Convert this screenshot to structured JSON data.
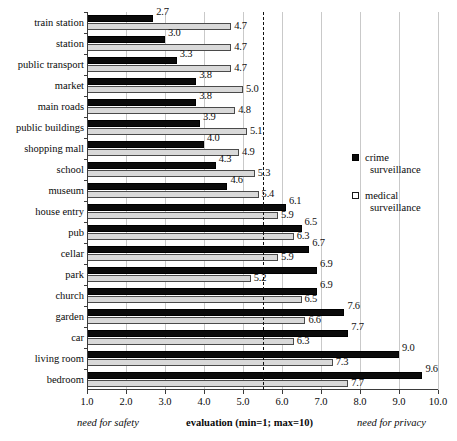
{
  "chart_data": {
    "type": "bar",
    "orientation": "horizontal",
    "title": "",
    "xlabel": "evaluation (min=1; max=10)",
    "ylabel": "",
    "xlim": [
      1.0,
      10.0
    ],
    "xticks": [
      "1.0",
      "2.0",
      "3.0",
      "4.0",
      "5.0",
      "6.0",
      "7.0",
      "8.0",
      "9.0",
      "10.0"
    ],
    "grid": true,
    "legend_position": "right",
    "reference_line": 5.5,
    "categories": [
      "train station",
      "station",
      "public transport",
      "market",
      "main roads",
      "public buildings",
      "shopping mall",
      "school",
      "museum",
      "house entry",
      "pub",
      "cellar",
      "park",
      "church",
      "garden",
      "car",
      "living room",
      "bedroom"
    ],
    "series": [
      {
        "name": "crime surveillance",
        "color": "#0b0b0b",
        "values": [
          2.7,
          3.0,
          3.3,
          3.8,
          3.8,
          3.9,
          4.0,
          4.3,
          4.6,
          6.1,
          6.5,
          6.7,
          6.9,
          6.9,
          7.6,
          7.7,
          9.0,
          9.6
        ],
        "labels": [
          "2.7",
          "3.0",
          "3.3",
          "3.8",
          "3.8",
          "3.9",
          "4.0",
          "4.3",
          "4.6",
          "6.1",
          "6.5",
          "6.7",
          "6.9",
          "6.9",
          "7.6",
          "7.7",
          "9.0",
          "9.6"
        ]
      },
      {
        "name": "medical surveillance",
        "color": "#d9d9d9",
        "values": [
          4.7,
          4.7,
          4.7,
          5.0,
          4.8,
          5.1,
          4.9,
          5.3,
          5.4,
          5.9,
          6.3,
          5.9,
          5.2,
          6.5,
          6.6,
          6.3,
          7.3,
          7.7
        ],
        "labels": [
          "4.7",
          "4.7",
          "4.7",
          "5.0",
          "4.8",
          "5.1",
          "4.9",
          "5.3",
          "5.4",
          "5.9",
          "6.3",
          "5.9",
          "5.2",
          "6.5",
          "6.6",
          "6.3",
          "7.3",
          "7.7"
        ]
      }
    ],
    "annotations": {
      "left_caption": "need for safety",
      "center_caption": "evaluation (min=1; max=10)",
      "right_caption": "need for privacy"
    }
  },
  "legend": {
    "items": [
      {
        "line1": "crime",
        "line2": "surveillance",
        "swatch": "filled-square-icon"
      },
      {
        "line1": "medical",
        "line2": "surveillance",
        "swatch": "open-square-icon"
      }
    ]
  }
}
